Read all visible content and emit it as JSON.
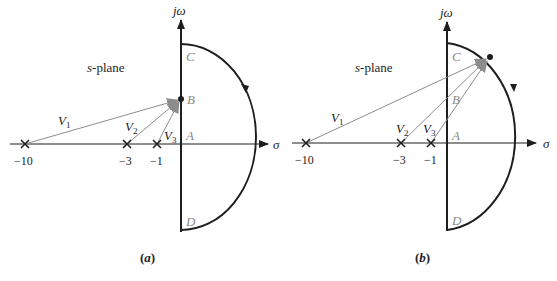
{
  "figure": {
    "panels": [
      {
        "id": "a",
        "caption": "(a)",
        "plane_label": "s-plane",
        "imag_axis_label": "jω",
        "real_axis_label": "σ",
        "point_labels": {
          "A": "A",
          "B": "B",
          "C": "C",
          "D": "D"
        },
        "test_point": "B (on jω axis)",
        "poles": [
          {
            "value": -10,
            "label": "−10"
          },
          {
            "value": -3,
            "label": "−3"
          },
          {
            "value": -1,
            "label": "−1"
          }
        ],
        "vectors": [
          {
            "name": "V1",
            "base": "V",
            "sub": "1",
            "from_pole": -10
          },
          {
            "name": "V2",
            "base": "V",
            "sub": "2",
            "from_pole": -3
          },
          {
            "name": "V3",
            "base": "V",
            "sub": "3",
            "from_pole": -1
          }
        ]
      },
      {
        "id": "b",
        "caption": "(b)",
        "plane_label": "s-plane",
        "imag_axis_label": "jω",
        "real_axis_label": "σ",
        "point_labels": {
          "A": "A",
          "B": "B",
          "C": "C",
          "D": "D"
        },
        "test_point": "point on semicircular arc between C and A",
        "poles": [
          {
            "value": -10,
            "label": "−10"
          },
          {
            "value": -3,
            "label": "−3"
          },
          {
            "value": -1,
            "label": "−1"
          }
        ],
        "vectors": [
          {
            "name": "V1",
            "base": "V",
            "sub": "1",
            "from_pole": -10
          },
          {
            "name": "V2",
            "base": "V",
            "sub": "2",
            "from_pole": -3
          },
          {
            "name": "V3",
            "base": "V",
            "sub": "3",
            "from_pole": -1
          }
        ]
      }
    ],
    "colors": {
      "axis": "#1e1e1e",
      "vector": "#8c8c8c",
      "point_label": "#8a8a8a"
    }
  }
}
